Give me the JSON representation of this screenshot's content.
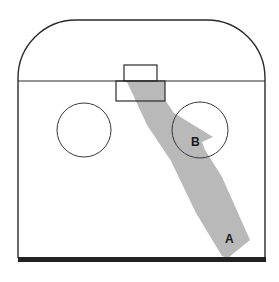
{
  "diagram": {
    "colors": {
      "line": "#2a2a2a",
      "shade": "#b9b9b9",
      "background": "#ffffff",
      "baseline": "#222222"
    },
    "labels": {
      "a": "A",
      "b": "B"
    }
  }
}
